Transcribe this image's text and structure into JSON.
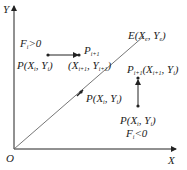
{
  "diagram": {
    "axes": {
      "origin_label": "O",
      "x_label": "X",
      "y_label": "Y"
    },
    "line": {
      "end_label": "E(X",
      "end_sub_x": "e",
      "end_mid": ", Y",
      "end_sub_y": "e",
      "end_close": ")"
    },
    "upper_left": {
      "condition_F": "F",
      "condition_sub": "i",
      "condition_rest": ">0",
      "point_P": "P(X",
      "point_sub_x": "i",
      "point_mid": ", Y",
      "point_sub_y": "i",
      "point_close": ")",
      "next_P": "P",
      "next_P_sub": "i+1",
      "next_coords_open": "(X",
      "next_coords_sub_x": "i+1",
      "next_coords_mid": ", Y",
      "next_coords_sub_y": "i+1",
      "next_coords_close": ")"
    },
    "on_line_point": {
      "label": "P(X",
      "sub_x": "i",
      "mid": ", Y",
      "sub_y": "i",
      "close": ")"
    },
    "lower_right": {
      "next_P": "P",
      "next_P_sub": "i+1",
      "next_coords_open": "(X",
      "next_coords_sub_x": "i+1",
      "next_coords_mid": ", Y",
      "next_coords_sub_y": "i",
      "next_coords_close": ")",
      "point_P": "P(X",
      "point_sub_x": "i",
      "point_mid": ", Y",
      "point_sub_y": "i",
      "point_close": ")",
      "condition_F": "F",
      "condition_sub": "i",
      "condition_rest": "<0"
    },
    "colors": {
      "axis": "#222222",
      "line": "#555555",
      "text": "#222222"
    }
  }
}
